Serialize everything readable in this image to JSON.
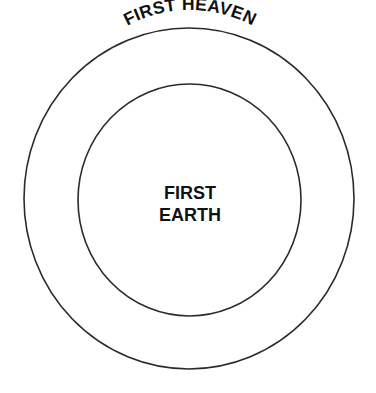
{
  "diagram": {
    "type": "concentric-circles",
    "outer_circle": {
      "label": "FIRST HEAVEN",
      "label_position": "arc-top-inside"
    },
    "inner_circle": {
      "label_lines": [
        "FIRST",
        "EARTH"
      ],
      "label_position": "center"
    },
    "colors": {
      "background": "#ffffff",
      "stroke": "#2a2a2a",
      "text": "#111111"
    }
  }
}
